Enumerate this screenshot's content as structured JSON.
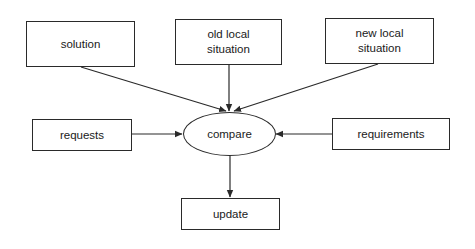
{
  "diagram": {
    "type": "flow",
    "nodes": [
      {
        "id": "solution",
        "label": "solution",
        "shape": "rect"
      },
      {
        "id": "old_local_situation",
        "label": "old local\nsituation",
        "shape": "rect"
      },
      {
        "id": "new_local_situation",
        "label": "new local\nsituation",
        "shape": "rect"
      },
      {
        "id": "requests",
        "label": "requests",
        "shape": "rect"
      },
      {
        "id": "compare",
        "label": "compare",
        "shape": "ellipse"
      },
      {
        "id": "requirements",
        "label": "requirements",
        "shape": "rect"
      },
      {
        "id": "update",
        "label": "update",
        "shape": "rect"
      }
    ],
    "edges": [
      {
        "from": "solution",
        "to": "compare"
      },
      {
        "from": "old_local_situation",
        "to": "compare"
      },
      {
        "from": "new_local_situation",
        "to": "compare"
      },
      {
        "from": "requests",
        "to": "compare"
      },
      {
        "from": "requirements",
        "to": "compare"
      },
      {
        "from": "compare",
        "to": "update"
      }
    ],
    "colors": {
      "stroke": "#2a2a2a",
      "background": "#ffffff",
      "text": "#1a1a1a"
    }
  }
}
